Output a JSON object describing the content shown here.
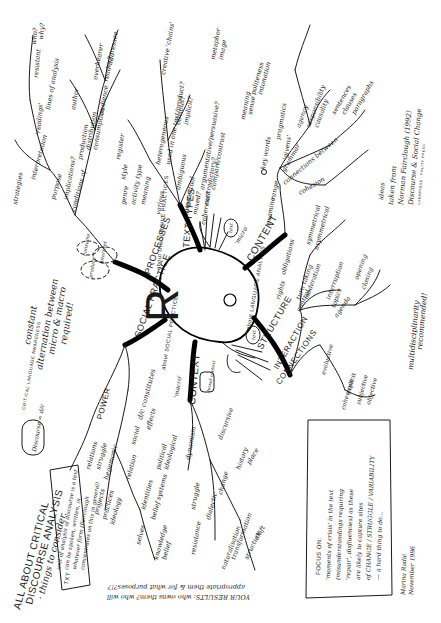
{
  "title": {
    "line1": "ALL ABOUT CRITICAL",
    "line2": "DISCOURSE ANALYSIS",
    "line3": "· things to consider."
  },
  "discourse_note": {
    "bubble": "Discourse = d/c",
    "critical_label": "CRITICAL LANGUAGE AWARENESS"
  },
  "text_note": {
    "label": "TXT",
    "lines": [
      "unit of analysis of discourse is a text",
      "can be spoken, written, in",
      "whatever form (Fairclough",
      "concentrates on this in general)"
    ]
  },
  "center_icon": "ear-and-hands-drawing",
  "center_letter": "R",
  "alternation_note": [
    "constant",
    "alternation between",
    "micro & macro",
    "required!"
  ],
  "results_note": {
    "line1": "YOUR RESULTS: who owns them? who will",
    "line2": "appropriate them & for what purposes?!?"
  },
  "focus_box": {
    "heading": "FOCUS ON:",
    "lines": [
      "'moments of crisis' in the text",
      "(misunderstandings requiring",
      "'repair', disfluencies) as these",
      "are likely to capture sites",
      "of CHANGE / STRUGGLE / VARIABILITY",
      "— a hard thing to do..."
    ]
  },
  "signature": {
    "name": "Marina Radić",
    "date": "November 1996"
  },
  "source_note": {
    "line1": "ideas",
    "line2": "taken from",
    "line3": "Norman Fairclough (1992)",
    "line4": "Discourse & Social Change",
    "line5": "CAMBRIDGE : POLITY PRESS"
  },
  "multidisciplinarity": [
    "multidisciplinarity",
    "recommended!"
  ],
  "branches": {
    "processes": {
      "label": "PROCESSES",
      "annotation": "about DISCURSIVE PRACTICES",
      "clouds": [
        "produce",
        "interpret",
        "consume"
      ],
      "sub": [
        "purpose",
        "production",
        "distribution",
        "consumption",
        "conditions of",
        "interpretation",
        "'readings'",
        "resistant",
        "who?",
        "why?",
        "strategies",
        "audience",
        "addressee",
        "overhearer",
        "reader?",
        "lines of analysis",
        "author",
        "implications?"
      ]
    },
    "text_types": {
      "label": "TEXT TYPES",
      "sub": [
        "genre",
        "style",
        "register",
        "activity type",
        "meaning",
        "heterogeneous",
        "various",
        "used in one text/product?",
        "obvious?",
        "implicit?",
        "ambiguous",
        "intertextual",
        "mixed?",
        "creative 'chains'",
        "coherent?",
        "contradictory?",
        "argumentative/persuasive?",
        "compare/contrast"
      ]
    },
    "content": {
      "label": "CONTENT",
      "annotation": "'micro'",
      "cloud": "text",
      "sub": [
        "examine",
        "range",
        "'givens'",
        "grammar",
        "agency",
        "responsibility",
        "causality",
        "connections between",
        "sentences",
        "clauses",
        "paragraphs",
        "cohesion",
        "pragmatics",
        "politeness",
        "intonation",
        "key words",
        "meaning",
        "sense",
        "metaphor",
        "image"
      ]
    },
    "structure": {
      "label": "STRUCTURE",
      "annotation": "about LANGUAGE ANALYSIS",
      "cloud": "text",
      "interaction": {
        "label": "INTERACTION",
        "sub": [
          "rights",
          "obligations",
          "symmetrical",
          "asymmetrical",
          "turn taking",
          "moderation",
          "control",
          "interruption",
          "topics",
          "agenda",
          "opening",
          "closing"
        ]
      },
      "connections": {
        "label": "CONNECTIONS",
        "sub": [
          "evaluative",
          "coherence",
          "explicit",
          "subjective",
          "objective"
        ]
      }
    },
    "social_practice": {
      "label": "SOCIAL PRACTICE",
      "annotation": "about SOCIAL PRACTICE",
      "sub_power": {
        "label": "POWER",
        "sub": [
          "relations",
          "struggle",
          "hegemonic",
          "projects",
          "practices",
          "ideology"
        ]
      },
      "sub_dc": {
        "label": "d/c constitutes",
        "sub": [
          "social",
          "effects",
          "relation",
          "political",
          "ideological",
          "identities",
          "belief systems",
          "knowledge",
          "belief",
          "selves"
        ]
      }
    },
    "context": {
      "label": "CONTEXT",
      "annotation": "'macro'",
      "cloud": "broad context",
      "sub": [
        "dynamism",
        "resistance",
        "struggle",
        "dialectic",
        "change",
        "naturalisation",
        "transformation",
        "structure",
        "shift",
        "history",
        "place",
        "discursive"
      ]
    }
  },
  "colors": {
    "ink": "#1a1a1a",
    "paper": "#ffffff"
  }
}
